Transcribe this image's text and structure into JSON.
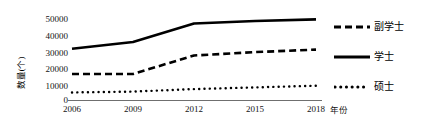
{
  "chart_data": {
    "type": "line",
    "title": "",
    "xlabel": "年份",
    "ylabel": "数量(个)",
    "x": [
      2006,
      2009,
      2012,
      2015,
      2018
    ],
    "categories": [
      "2006",
      "2009",
      "2012",
      "2015",
      "2018"
    ],
    "xlim": [
      2006,
      2018
    ],
    "ylim": [
      0,
      50000
    ],
    "yticks": [
      50000,
      40000,
      30000,
      20000,
      10000,
      0
    ],
    "ytick_labels": [
      "50000",
      "40000",
      "30000",
      "20000",
      "10000",
      "0"
    ],
    "grid": false,
    "legend_position": "right",
    "series": [
      {
        "name": "副学士",
        "style": "dashed",
        "color": "#000000",
        "values": [
          15500,
          15500,
          26500,
          28500,
          30000
        ]
      },
      {
        "name": "学士",
        "style": "solid",
        "color": "#000000",
        "values": [
          30500,
          34500,
          45500,
          47000,
          48000
        ]
      },
      {
        "name": "硕士",
        "style": "dotted",
        "color": "#000000",
        "values": [
          4500,
          5000,
          6500,
          7500,
          8500
        ]
      }
    ]
  },
  "axes": {
    "y_title": "数量(个)",
    "x_title": "年份",
    "axis_color": "#6f6f6f"
  },
  "legend": {
    "items": [
      {
        "label": "副学士",
        "style": "dashed"
      },
      {
        "label": "学士",
        "style": "solid"
      },
      {
        "label": "硕士",
        "style": "dotted"
      }
    ]
  }
}
